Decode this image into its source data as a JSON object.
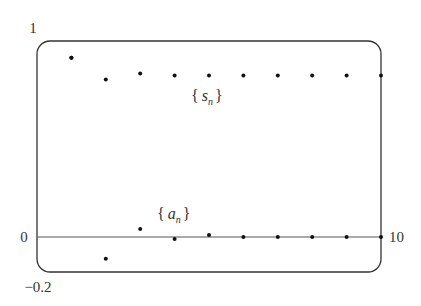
{
  "chart_data": {
    "type": "scatter",
    "title": "",
    "xlabel": "",
    "ylabel": "",
    "xlim": [
      0,
      10
    ],
    "ylim": [
      -0.2,
      1
    ],
    "grid": false,
    "legend": "none (inline labels)",
    "x_tick_labels": [
      "0",
      "10"
    ],
    "y_tick_labels": [
      "1",
      "0",
      "-0.2"
    ],
    "annotations": [
      "{s_n}",
      "{a_n}"
    ],
    "x": [
      1,
      2,
      3,
      4,
      5,
      6,
      7,
      8,
      9,
      10
    ],
    "series": [
      {
        "name": "{s_n}",
        "values": [
          0.91,
          0.8,
          0.83,
          0.82,
          0.82,
          0.82,
          0.82,
          0.82,
          0.82,
          0.82
        ]
      },
      {
        "name": "{a_n}",
        "values": [
          0.91,
          -0.11,
          0.04,
          -0.01,
          0.01,
          0.0,
          0.0,
          0.0,
          0.0,
          0.0
        ]
      }
    ]
  },
  "labels": {
    "y_top": "1",
    "y_zero": "0",
    "y_bottom": "−0.2",
    "x_right": "10",
    "s_series_letter": "s",
    "s_series_sub": "n",
    "a_series_letter": "a",
    "a_series_sub": "n",
    "brace_open": "{",
    "brace_close": "}"
  },
  "colors": {
    "frame": "#333333",
    "axis": "#555555",
    "points": "#111111",
    "text": "#333333"
  }
}
